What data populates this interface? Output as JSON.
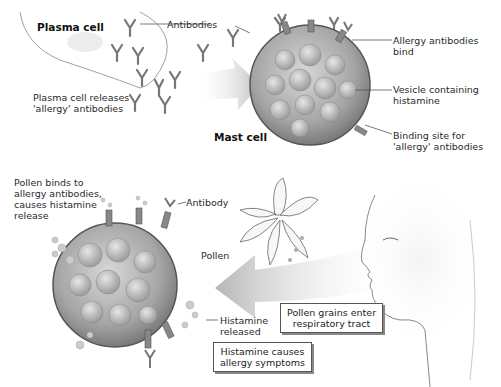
{
  "figure": {
    "top_panel": {
      "plasma_cell_label": "Plasma cell",
      "antibodies_label": "Antibodies",
      "plasma_release_label": "Plasma cell releases\n'allergy' antibodies",
      "mast_cell_label": "Mast cell",
      "allergy_bind_label": "Allergy antibodies bind",
      "vesicle_label": "Vesicle containing\nhistamine",
      "binding_site_label": "Binding site for\n'allergy' antibodies"
    },
    "bottom_panel": {
      "pollen_binds_label": "Pollen binds to\nallergy antibodies,\ncauses histamine\nrelease",
      "antibody_label": "Antibody",
      "pollen_label": "Pollen",
      "histamine_released_label": "Histamine\nreleased",
      "pollen_enter_box": "Pollen grains enter\nrespiratory tract",
      "histamine_symptoms_box": "Histamine causes\nallergy symptoms"
    },
    "colors": {
      "background": "#ffffff",
      "cell_gray": "#9a9a9a",
      "arrow_gray": "#c8c8c8",
      "line": "#444444"
    }
  }
}
